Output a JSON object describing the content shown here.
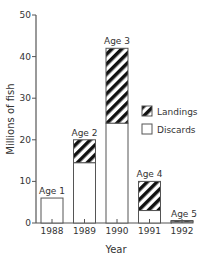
{
  "chart_data": {
    "type": "bar",
    "stacked": true,
    "title": "",
    "xlabel": "Year",
    "ylabel": "Millions of fish",
    "ylim": [
      0,
      50
    ],
    "yticks": [
      0,
      10,
      20,
      30,
      40,
      50
    ],
    "categories": [
      "1988",
      "1989",
      "1990",
      "1991",
      "1992"
    ],
    "bar_labels": [
      "Age 1",
      "Age 2",
      "Age 3",
      "Age 4",
      "Age 5"
    ],
    "series": [
      {
        "name": "Discards",
        "values": [
          6,
          14.5,
          24,
          3,
          0.3
        ]
      },
      {
        "name": "Landings",
        "values": [
          0,
          5.5,
          18,
          7,
          0.3
        ]
      }
    ],
    "totals": [
      6,
      20,
      42,
      10,
      0.6
    ],
    "legend": {
      "position": "right",
      "entries": [
        "Landings",
        "Discards"
      ]
    },
    "grid": false
  }
}
